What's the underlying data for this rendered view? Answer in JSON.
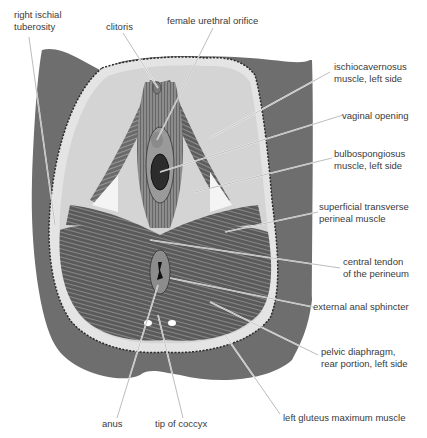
{
  "figure": {
    "colors": {
      "body": "#6e6e6e",
      "skin_edge": "#dcdcdc",
      "fat": "#d6d6d6",
      "muscle": "#555555",
      "muscle_light": "#9a9a9a",
      "label_text": "#3a3a3a",
      "leader_line": "#ffffff"
    }
  },
  "labels": [
    {
      "id": "right-ischial-tuberosity",
      "text": "right ischial\ntuberosity"
    },
    {
      "id": "clitoris",
      "text": "clitoris"
    },
    {
      "id": "female-urethral-orifice",
      "text": "female urethral orifice"
    },
    {
      "id": "ischiocavernosus",
      "text": "ischiocavernosus\nmuscle, left side"
    },
    {
      "id": "vaginal-opening",
      "text": "vaginal opening"
    },
    {
      "id": "bulbospongiosus",
      "text": "bulbospongiosus\nmuscle, left side"
    },
    {
      "id": "superficial-transverse-perineal",
      "text": "superficial transverse\nperineal muscle"
    },
    {
      "id": "central-tendon",
      "text": "central tendon\nof the perineum"
    },
    {
      "id": "external-anal-sphincter",
      "text": "external anal sphincter"
    },
    {
      "id": "pelvic-diaphragm",
      "text": "pelvic diaphragm,\nrear portion, left side"
    },
    {
      "id": "left-gluteus-maximus",
      "text": "left gluteus maximum muscle"
    },
    {
      "id": "anus",
      "text": "anus"
    },
    {
      "id": "tip-of-coccyx",
      "text": "tip of coccyx"
    }
  ]
}
